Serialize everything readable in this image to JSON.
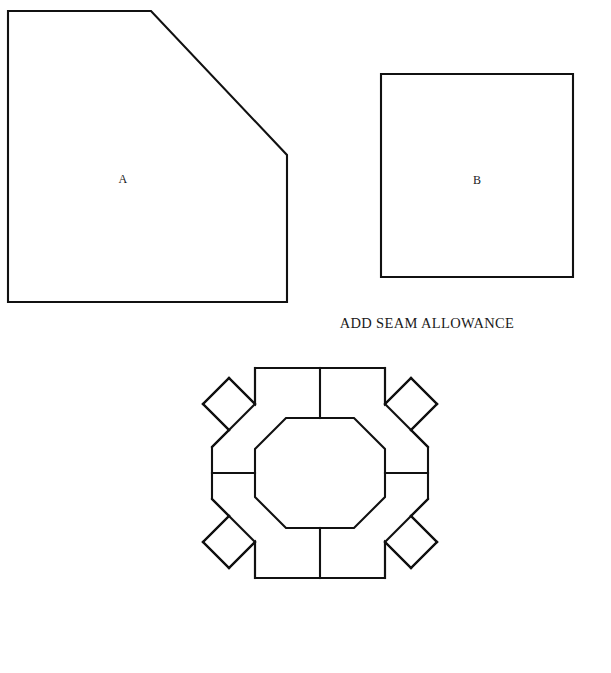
{
  "page": {
    "background_color": "#ffffff",
    "ink_color": "#111111",
    "width": 611,
    "height": 673
  },
  "pieces": [
    {
      "id": "piece-a",
      "label": "A",
      "shape": "pentagon",
      "description": "Square with one corner cut off on the upper right",
      "label_x": 123,
      "label_y": 180,
      "points": "8,11 151,11 287,155 287,302 8,302"
    },
    {
      "id": "piece-b",
      "label": "B",
      "shape": "square",
      "description": "Plain square template piece",
      "label_x": 477,
      "label_y": 181,
      "points": "381,74 573,74 573,277 381,277"
    }
  ],
  "caption": {
    "text": "ADD SEAM ALLOWANCE",
    "x": 427,
    "y": 328
  },
  "assembly_diagram": {
    "name": "octagon-block-layout",
    "description": "Assembled block: central octagon ringed by eight pentagon pieces A and four square pieces B set on point",
    "center_x": 320,
    "center_y": 473,
    "center_octagon": "286,418 354,418 385,449 385,497 354,528 286,528 255,497 255,449",
    "outline": "255,368 385,368 385,404 411,378 437,404 411,430 428,447 428,499 411,516 437,542 411,568 385,542 385,578 255,578 255,542 229,568 203,542 229,516 212,499 212,447 229,430 203,404 229,378 255,404",
    "seam_lines": [
      "M320,368 L320,418",
      "M320,528 L320,578",
      "M255,368 L255,404",
      "M385,368 L385,404",
      "M255,578 L255,542",
      "M385,578 L385,542",
      "M212,473 L255,473",
      "M385,473 L428,473",
      "M212,447 L229,430",
      "M212,499 L229,516",
      "M428,447 L411,430",
      "M428,499 L411,516",
      "M229,430 L255,404",
      "M229,516 L255,542",
      "M411,430 L385,404",
      "M411,516 L385,542",
      "M203,404 L229,378",
      "M229,378 L255,404",
      "M203,542 L229,568",
      "M229,568 L255,542",
      "M437,404 L411,378",
      "M411,378 L385,404",
      "M437,542 L411,568",
      "M411,568 L385,542",
      "M203,404 L229,430",
      "M203,542 L229,516",
      "M437,404 L411,430",
      "M437,542 L411,516"
    ]
  }
}
